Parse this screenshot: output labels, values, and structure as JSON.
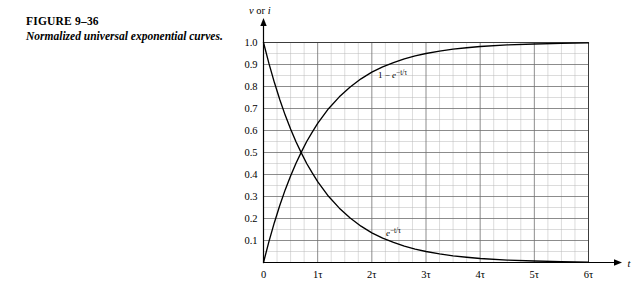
{
  "figure": {
    "number": "FIGURE 9–36",
    "caption": "Normalized universal exponential curves."
  },
  "chart_data": {
    "type": "line",
    "title": "",
    "xlabel": "t",
    "ylabel": "v or i",
    "xlim": [
      0,
      6
    ],
    "ylim": [
      0,
      1.05
    ],
    "grid": true,
    "grid_minor_x_per_tau": 4,
    "grid_minor_y_step": 0.1,
    "legend": "inline-annotations",
    "xtick_labels": [
      "0",
      "1τ",
      "2τ",
      "3τ",
      "4τ",
      "5τ",
      "6τ"
    ],
    "xtick_values": [
      0,
      1,
      2,
      3,
      4,
      5,
      6
    ],
    "ytick_labels": [
      "0.1",
      "0.2",
      "0.3",
      "0.4",
      "0.5",
      "0.6",
      "0.7",
      "0.8",
      "0.9",
      "1.0"
    ],
    "ytick_values": [
      0.1,
      0.2,
      0.3,
      0.4,
      0.5,
      0.6,
      0.7,
      0.8,
      0.9,
      1.0
    ],
    "axis_arrow_x_label": "t",
    "axis_arrow_y_label": "v or i",
    "series": [
      {
        "name": "rising-exponential",
        "label": "1 − e−t/τ",
        "label_base": "1 − e",
        "label_exponent": "−t/τ",
        "color": "#000000",
        "x": [
          0,
          0.1,
          0.2,
          0.3,
          0.4,
          0.5,
          0.6,
          0.7,
          0.8,
          0.9,
          1.0,
          1.2,
          1.4,
          1.6,
          1.8,
          2.0,
          2.2,
          2.4,
          2.6,
          2.8,
          3.0,
          3.25,
          3.5,
          3.75,
          4.0,
          4.5,
          5.0,
          5.5,
          6.0
        ],
        "y": [
          0.0,
          0.095,
          0.181,
          0.259,
          0.33,
          0.393,
          0.451,
          0.503,
          0.551,
          0.593,
          0.632,
          0.699,
          0.753,
          0.798,
          0.835,
          0.865,
          0.889,
          0.909,
          0.926,
          0.939,
          0.95,
          0.961,
          0.97,
          0.976,
          0.982,
          0.989,
          0.993,
          0.996,
          0.998
        ]
      },
      {
        "name": "decaying-exponential",
        "label": "e−t/τ",
        "label_base": "e",
        "label_exponent": "−t/τ",
        "color": "#000000",
        "x": [
          0,
          0.1,
          0.2,
          0.3,
          0.4,
          0.5,
          0.6,
          0.7,
          0.8,
          0.9,
          1.0,
          1.2,
          1.4,
          1.6,
          1.8,
          2.0,
          2.2,
          2.4,
          2.6,
          2.8,
          3.0,
          3.25,
          3.5,
          3.75,
          4.0,
          4.5,
          5.0,
          5.5,
          6.0
        ],
        "y": [
          1.0,
          0.905,
          0.819,
          0.741,
          0.67,
          0.607,
          0.549,
          0.497,
          0.449,
          0.407,
          0.368,
          0.301,
          0.247,
          0.202,
          0.165,
          0.135,
          0.111,
          0.091,
          0.074,
          0.061,
          0.05,
          0.039,
          0.03,
          0.024,
          0.018,
          0.011,
          0.007,
          0.004,
          0.002
        ]
      }
    ],
    "intersection": {
      "x": 0.693,
      "y": 0.5
    }
  }
}
